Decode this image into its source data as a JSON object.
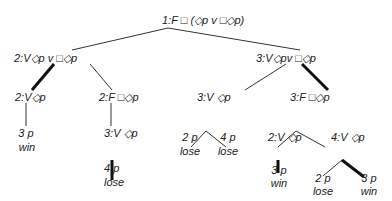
{
  "diagram": {
    "type": "game-tree",
    "nodes": [
      {
        "id": "n1",
        "label": "1:F □ (◇p ᴠ □◇p)"
      },
      {
        "id": "n2",
        "label": "2:V◇p ᴠ □◇p"
      },
      {
        "id": "n3",
        "label": "3:V◇pᴠ □◇p"
      },
      {
        "id": "n4",
        "label": "2:V◇p"
      },
      {
        "id": "n5",
        "label": "2:F □◇p"
      },
      {
        "id": "n6",
        "label": "3:V ◇p"
      },
      {
        "id": "n7",
        "label": "3:F □◇p"
      },
      {
        "id": "n8",
        "label": "3 p",
        "outcome": "win"
      },
      {
        "id": "n9",
        "label": "3:V ◇p"
      },
      {
        "id": "n10",
        "label": "4 p",
        "outcome": "lose"
      },
      {
        "id": "n11",
        "label": "2 p",
        "outcome": "lose"
      },
      {
        "id": "n12",
        "label": "4 p",
        "outcome": "lose"
      },
      {
        "id": "n13",
        "label": "2:V ◇p"
      },
      {
        "id": "n14",
        "label": "4:V ◇p"
      },
      {
        "id": "n15",
        "label": "3 p",
        "outcome": "win"
      },
      {
        "id": "n16",
        "label": "2 p",
        "outcome": "lose"
      },
      {
        "id": "n17",
        "label": "3 p",
        "outcome": "win"
      }
    ],
    "edges": [
      {
        "from": "n1",
        "to": "n2",
        "weight": "thin"
      },
      {
        "from": "n1",
        "to": "n3",
        "weight": "thin"
      },
      {
        "from": "n2",
        "to": "n4",
        "weight": "thick"
      },
      {
        "from": "n2",
        "to": "n5",
        "weight": "thin"
      },
      {
        "from": "n3",
        "to": "n6",
        "weight": "thin"
      },
      {
        "from": "n3",
        "to": "n7",
        "weight": "thick"
      },
      {
        "from": "n4",
        "to": "n8",
        "weight": "thin"
      },
      {
        "from": "n5",
        "to": "n9",
        "weight": "thin"
      },
      {
        "from": "n9",
        "to": "n10",
        "weight": "thick"
      },
      {
        "from": "n6",
        "to": "n11",
        "weight": "thin"
      },
      {
        "from": "n6",
        "to": "n12",
        "weight": "thin"
      },
      {
        "from": "n7",
        "to": "n13",
        "weight": "thin"
      },
      {
        "from": "n7",
        "to": "n14",
        "weight": "thin"
      },
      {
        "from": "n13",
        "to": "n15",
        "weight": "thick"
      },
      {
        "from": "n14",
        "to": "n16",
        "weight": "thin"
      },
      {
        "from": "n14",
        "to": "n17",
        "weight": "thick"
      }
    ]
  }
}
